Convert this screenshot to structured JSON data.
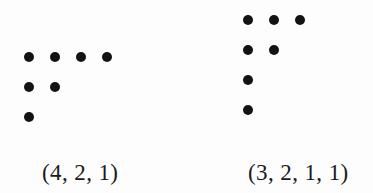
{
  "figure": {
    "background_color": "#fdfdfd",
    "dot_color": "#131313",
    "text_color": "#1b1b1b",
    "diagrams": [
      {
        "name": "ferrers-diagram-left",
        "label": "(4, 2, 1)",
        "row_sizes": [
          4,
          2,
          1
        ],
        "total_dots": 7
      },
      {
        "name": "ferrers-diagram-right",
        "label": "(3, 2, 1, 1)",
        "row_sizes": [
          3,
          2,
          1,
          1
        ],
        "total_dots": 7
      }
    ]
  },
  "chart_data": {
    "type": "scatter",
    "title": "",
    "subtitle": "",
    "xlabel": "",
    "ylabel": "",
    "grid": false,
    "legend": "none",
    "series": [
      {
        "name": "(4, 2, 1)",
        "row_sizes": [
          4,
          2,
          1
        ],
        "points": [
          [
            1,
            1
          ],
          [
            2,
            1
          ],
          [
            3,
            1
          ],
          [
            4,
            1
          ],
          [
            1,
            2
          ],
          [
            2,
            2
          ],
          [
            1,
            3
          ]
        ]
      },
      {
        "name": "(3, 2, 1, 1)",
        "row_sizes": [
          3,
          2,
          1,
          1
        ],
        "points": [
          [
            1,
            1
          ],
          [
            2,
            1
          ],
          [
            3,
            1
          ],
          [
            1,
            2
          ],
          [
            2,
            2
          ],
          [
            1,
            3
          ],
          [
            1,
            4
          ]
        ]
      }
    ],
    "annotations": [
      "(4, 2, 1)",
      "(3, 2, 1, 1)"
    ]
  }
}
